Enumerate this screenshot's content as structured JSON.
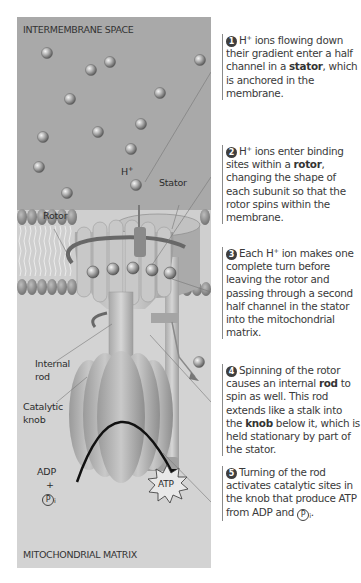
{
  "regions": {
    "top": "INTERMEMBRANE SPACE",
    "bottom": "MITOCHONDRIAL MATRIX"
  },
  "diagram_labels": {
    "h_ion": "H",
    "h_ion_sup": "+",
    "stator": "Stator",
    "rotor": "Rotor",
    "internal_rod_1": "Internal",
    "internal_rod_2": "rod",
    "catalytic_knob_1": "Catalytic",
    "catalytic_knob_2": "knob",
    "adp": "ADP",
    "plus": "+",
    "pi_letter": "P",
    "pi_sub": "i",
    "atp": "ATP"
  },
  "colors": {
    "intermembrane_bg": "#a9a9a9",
    "matrix_bg": "#d3d3d3",
    "membrane_head": "#8f8f8f",
    "protein": "#c4c4c4",
    "ion": "#9a9a9a",
    "step_number_bg": "#3e3e3e"
  },
  "steps": [
    {
      "number": "1",
      "parts": [
        "H",
        "+",
        " ions flowing down their gradient enter a half channel in a ",
        "stator",
        ", which is anchored in the membrane."
      ]
    },
    {
      "number": "2",
      "parts": [
        "H",
        "+",
        " ions enter binding sites within a ",
        "rotor",
        ", changing the shape of each subunit so that the rotor spins within the membrane."
      ]
    },
    {
      "number": "3",
      "parts": [
        "Each H",
        "+",
        " ion makes one complete turn before leaving the rotor and passing through a second half channel in the stator into the mitochondrial matrix."
      ]
    },
    {
      "number": "4",
      "parts": [
        "Spinning of the rotor causes an internal ",
        "rod",
        " to spin as well. This rod extends like a stalk into the ",
        "knob",
        " below it, which is held stationary by part of the stator."
      ]
    },
    {
      "number": "5",
      "parts": [
        "Turning of the rod activates catalytic sites in the knob that produce ATP from ADP and ",
        "P",
        "i",
        "."
      ]
    }
  ]
}
